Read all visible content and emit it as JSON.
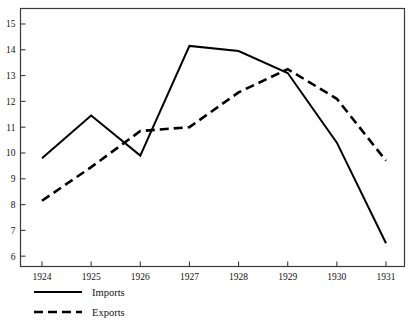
{
  "chart_data": {
    "type": "line",
    "title": "",
    "subtitle": "",
    "xlabel": "",
    "ylabel": "",
    "categories": [
      "1924",
      "1925",
      "1926",
      "1927",
      "1928",
      "1929",
      "1930",
      "1931"
    ],
    "x": [
      1924,
      1925,
      1926,
      1927,
      1928,
      1929,
      1930,
      1931
    ],
    "series": [
      {
        "name": "Imports",
        "style": "solid",
        "color": "#000000",
        "values": [
          9.8,
          11.45,
          9.9,
          14.15,
          13.95,
          13.1,
          10.4,
          6.5
        ]
      },
      {
        "name": "Exports",
        "style": "dashed",
        "color": "#000000",
        "values": [
          8.15,
          9.45,
          10.85,
          11.0,
          12.35,
          13.25,
          12.1,
          9.7
        ]
      }
    ],
    "ylim": [
      5.6,
      15.6
    ],
    "yticks": [
      6,
      7,
      8,
      9,
      10,
      11,
      12,
      13,
      14,
      15
    ],
    "ytick_labels": [
      "6",
      "7",
      "8",
      "9",
      "10",
      "11",
      "12",
      "13",
      "14",
      "15"
    ],
    "xtick_labels": [
      "1924",
      "1925",
      "1926",
      "1927",
      "1928",
      "1929",
      "1930",
      "1931"
    ],
    "grid": false,
    "legend_position": "below-left",
    "frame": "box"
  },
  "legend": {
    "entries": [
      {
        "label": "Imports",
        "style": "solid"
      },
      {
        "label": "Exports",
        "style": "dashed"
      }
    ]
  },
  "axes": {
    "y_tick_labels": [
      "15",
      "14",
      "13",
      "12",
      "11",
      "10",
      "9",
      "8",
      "7",
      "6"
    ],
    "x_tick_labels": [
      "1924",
      "1925",
      "1926",
      "1927",
      "1928",
      "1929",
      "1930",
      "1931"
    ]
  }
}
